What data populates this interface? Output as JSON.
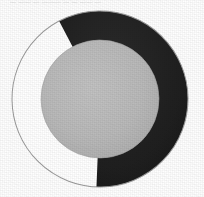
{
  "figure": {
    "background_color": "#fefefe",
    "caption_remnant": "— —— — ——— — — —— —",
    "width": 204,
    "height": 197
  },
  "chart_data": {
    "type": "pie",
    "variant": "donut",
    "title": "",
    "subtitle": "",
    "xlabel": "",
    "ylabel": "",
    "grid": false,
    "legend": false,
    "legend_position": "none",
    "labels_shown": false,
    "start_angle_deg": -27,
    "direction": "clockwise",
    "center": {
      "x": 100,
      "y": 99
    },
    "outer_radius": 88,
    "inner_radius": 59,
    "hub_color": "#b8b8b8",
    "outline_color": "#9a9a9a",
    "outline_width": 1,
    "categories": [
      "Filled",
      "Unfilled"
    ],
    "values": [
      58,
      42
    ],
    "angles_deg": [
      210,
      150
    ],
    "colors": [
      "#1f1f1f",
      "#ffffff"
    ],
    "segments": [
      {
        "label": "Filled",
        "value": 58,
        "angle_deg": 210,
        "start_deg": -27,
        "end_deg": 183,
        "color": "#1f1f1f"
      },
      {
        "label": "Unfilled",
        "value": 42,
        "angle_deg": 150,
        "start_deg": 183,
        "end_deg": 333,
        "color": "#ffffff"
      }
    ]
  }
}
